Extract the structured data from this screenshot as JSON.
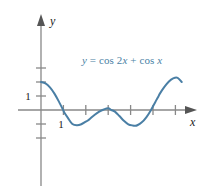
{
  "figure": {
    "name": "graph-of-cos-2x-plus-cos-x",
    "background_color": "#ffffff",
    "width": 211,
    "height": 188
  },
  "axes": {
    "x_axis_label": "x",
    "y_axis_label": "y",
    "axis_color": "#888888",
    "arrow_color": "#555555",
    "label_color": "#1a1a1a",
    "origin_px": {
      "x": 41,
      "y": 110
    },
    "unit_px": {
      "x": 22.4,
      "y": 14.0
    },
    "x_tick_values": [
      1,
      2,
      3,
      4,
      5,
      6
    ],
    "y_tick_values": [
      1,
      2,
      3,
      -1,
      -2
    ],
    "x_tick_labels": [
      {
        "value": 1,
        "text": "1"
      }
    ],
    "y_tick_labels": [
      {
        "value": 1,
        "text": "1"
      }
    ],
    "x_range": [
      -0.6,
      7.2
    ],
    "y_range": [
      -5.0,
      5.2
    ]
  },
  "equation_label": {
    "full_text": "y = cos 2x + cos x",
    "color": "#4a7fa5",
    "parts": [
      {
        "text": "y",
        "style": "italic"
      },
      {
        "text": " = ",
        "style": "roman"
      },
      {
        "text": "cos 2",
        "style": "roman"
      },
      {
        "text": "x",
        "style": "italic"
      },
      {
        "text": " + ",
        "style": "roman"
      },
      {
        "text": "cos ",
        "style": "roman"
      },
      {
        "text": "x",
        "style": "italic"
      }
    ]
  },
  "chart_data": {
    "type": "line",
    "title": "",
    "xlabel": "x",
    "ylabel": "y",
    "function": "y = cos 2x + cos x",
    "curve_color": "#4a7fa5",
    "grid": false,
    "legend": "none",
    "xlim": [
      0,
      6.283185
    ],
    "ylim": [
      -1.125,
      2
    ],
    "axis_xlim": [
      -0.6,
      7.2
    ],
    "axis_ylim": [
      -5.0,
      5.2
    ],
    "x": [
      0,
      0.2,
      0.4,
      0.6,
      0.8,
      1.0,
      1.047198,
      1.2,
      1.4,
      1.6,
      1.8,
      2.0,
      2.094395,
      2.2,
      2.4,
      2.6,
      2.8,
      3.0,
      3.141593,
      3.3,
      3.5,
      3.7,
      3.9,
      4.1,
      4.18879,
      4.3,
      4.5,
      4.7,
      4.9,
      5.1,
      5.235988,
      5.3,
      5.5,
      5.7,
      5.9,
      6.1,
      6.283185
    ],
    "y": [
      2.0,
      1.902,
      1.617,
      1.17,
      0.6,
      -0.036,
      -0.2,
      -0.565,
      -1.0,
      -1.093,
      -1.02,
      -0.832,
      -0.75,
      -0.604,
      -0.337,
      -0.11,
      0.04,
      0.12,
      0.0,
      -0.115,
      -0.43,
      -0.77,
      -1.02,
      -1.11,
      -1.125,
      -1.09,
      -0.88,
      -0.52,
      -0.03,
      0.56,
      0.95,
      1.15,
      1.63,
      2.02,
      2.26,
      2.3,
      2.0
    ],
    "key_points": [
      {
        "label": "y-intercept",
        "x": 0,
        "y": 2
      },
      {
        "label": "zero",
        "x": 1.047198,
        "y": 0
      },
      {
        "label": "local-minimum",
        "x": 1.682,
        "y": -1.125
      },
      {
        "label": "local-maximum",
        "x": 3.141593,
        "y": 0
      },
      {
        "label": "local-minimum",
        "x": 4.601,
        "y": -1.125
      },
      {
        "label": "zero",
        "x": 5.235988,
        "y": 0
      },
      {
        "label": "endpoint",
        "x": 6.283185,
        "y": 2
      }
    ]
  }
}
